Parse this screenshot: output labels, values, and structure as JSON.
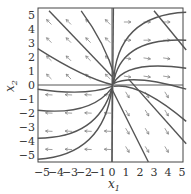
{
  "chart_data": {
    "type": "phase-portrait",
    "title": "",
    "xlabel": "x1",
    "ylabel": "x2",
    "xlim": [
      -5.3,
      5.3
    ],
    "ylim": [
      -5.5,
      5.5
    ],
    "xticks": [
      "-5",
      "-4",
      "-3",
      "-2",
      "-1",
      "0",
      "1",
      "2",
      "3",
      "4",
      "5"
    ],
    "yticks": [
      "5",
      "4",
      "3",
      "2",
      "1",
      "0",
      "-1",
      "-2",
      "-3",
      "-4",
      "-5"
    ],
    "grid": false,
    "axes_lines": [
      "x1=0",
      "x2=0"
    ]
  },
  "axes": {
    "xlabel_main": "x",
    "xlabel_sub": "1",
    "ylabel_main": "x",
    "ylabel_sub": "2"
  }
}
